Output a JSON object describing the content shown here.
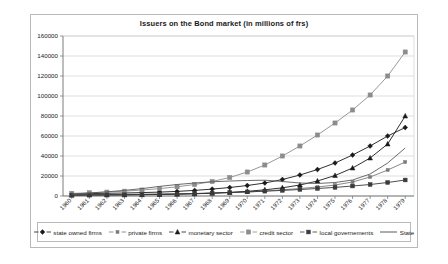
{
  "chart_data": {
    "type": "line",
    "title": "Issuers on the Bond market (in millions of frs)",
    "xlabel": "",
    "ylabel": "",
    "ylim": [
      0,
      160000
    ],
    "ytick_step": 20000,
    "yticks": [
      "0",
      "20000",
      "40000",
      "60000",
      "80000",
      "100000",
      "120000",
      "140000",
      "160000"
    ],
    "grid": true,
    "legend_position": "bottom",
    "categories": [
      "1960",
      "1961",
      "1962",
      "1963",
      "1964",
      "1965",
      "1966",
      "1967",
      "1968",
      "1969",
      "1970",
      "1971",
      "1972",
      "1973",
      "1974",
      "1975",
      "1976",
      "1977",
      "1978",
      "1979"
    ],
    "series": [
      {
        "name": "state owned firms",
        "marker": "diamond",
        "color": "#1a1a1a",
        "values": [
          2100,
          2400,
          2700,
          3000,
          3400,
          3900,
          4600,
          5600,
          6900,
          8500,
          10500,
          13000,
          16500,
          21000,
          26500,
          33000,
          41000,
          50000,
          60000,
          68500
        ]
      },
      {
        "name": "private firms",
        "marker": "small-square",
        "color": "#7a7a7a",
        "values": [
          1400,
          1500,
          1600,
          1700,
          1800,
          2000,
          2200,
          2500,
          2900,
          3400,
          4000,
          5000,
          6200,
          7500,
          9000,
          11000,
          14000,
          19000,
          26000,
          34000
        ]
      },
      {
        "name": "monetary sector",
        "marker": "triangle",
        "color": "#1a1a1a",
        "values": [
          800,
          900,
          1000,
          1100,
          1300,
          1500,
          1800,
          2200,
          2800,
          3600,
          4700,
          6200,
          8200,
          11000,
          15000,
          20500,
          28000,
          38000,
          52000,
          80000
        ]
      },
      {
        "name": "credit sector",
        "marker": "square",
        "color": "#8c8c8c",
        "values": [
          2600,
          3200,
          3900,
          4800,
          6000,
          7400,
          9200,
          11500,
          14500,
          18500,
          24000,
          31000,
          40000,
          50000,
          61000,
          73000,
          86000,
          101000,
          120000,
          144000
        ]
      },
      {
        "name": "local governements",
        "marker": "dash-dot",
        "color": "#3a3a3a",
        "values": [
          1000,
          1100,
          1200,
          1300,
          1500,
          1700,
          2000,
          2400,
          2900,
          3500,
          4100,
          4800,
          5600,
          6500,
          7500,
          8600,
          10000,
          11500,
          13500,
          16000
        ]
      },
      {
        "name": "State",
        "marker": "none",
        "color": "#5a5a5a",
        "values": [
          2000,
          3000,
          4200,
          5600,
          7400,
          9600,
          11500,
          13000,
          14200,
          15000,
          15500,
          15800,
          14500,
          13000,
          12500,
          13500,
          16000,
          22000,
          33000,
          48000
        ]
      }
    ]
  }
}
